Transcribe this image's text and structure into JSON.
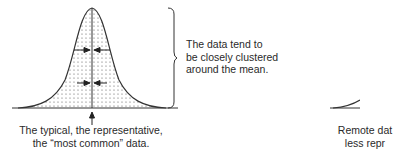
{
  "figure": {
    "title": "",
    "left_panel": {
      "caption_line1": "The typical, the representative,",
      "caption_line2": "the “most common” data.",
      "brace_text_line1": "The data tend to",
      "brace_text_line2": "be closely clustered",
      "brace_text_line3": "around the mean."
    },
    "right_panel": {
      "caption_line1": "Remote dat",
      "caption_line2": "less repr"
    },
    "colors": {
      "line": "#333333",
      "fill_dots": "#555555",
      "background": "#ffffff"
    }
  }
}
